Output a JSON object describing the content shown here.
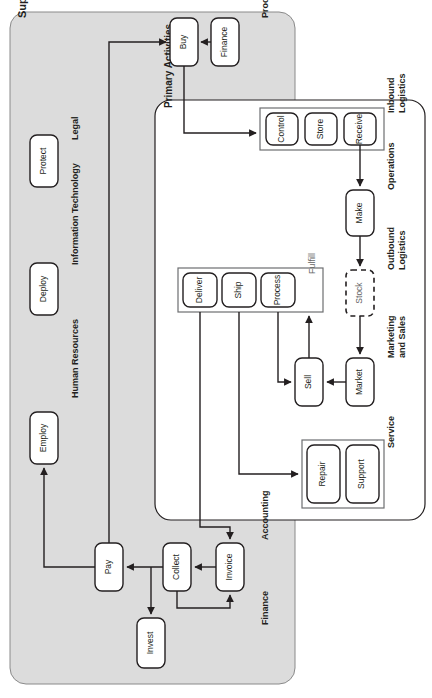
{
  "diagram": {
    "orientation": "rotated-90-ccw",
    "colors": {
      "panel_support_fill": "#dcdcdc",
      "panel_primary_fill": "#ffffff",
      "node_fill": "#ffffff",
      "stroke": "#231f20",
      "subgroup_stroke": "#6d6e71",
      "text": "#231f20"
    },
    "panels": [
      {
        "id": "support",
        "label": "Support Activities",
        "fill": "#dcdcdc"
      },
      {
        "id": "primary",
        "label": "Primary Activities",
        "fill": "#ffffff"
      }
    ],
    "sections": [
      {
        "id": "procurement",
        "label": "Procurement",
        "panel": "support"
      },
      {
        "id": "legal",
        "label": "Legal",
        "panel": "support"
      },
      {
        "id": "information_technology",
        "label": "Information Technology",
        "panel": "support"
      },
      {
        "id": "human_resources",
        "label": "Human Resources",
        "panel": "support"
      },
      {
        "id": "accounting",
        "label": "Accounting",
        "panel": "support"
      },
      {
        "id": "finance",
        "label": "Finance",
        "panel": "support"
      },
      {
        "id": "inbound_logistics",
        "label": "Inbound\nLogistics",
        "panel": "primary"
      },
      {
        "id": "operations",
        "label": "Operations",
        "panel": "primary"
      },
      {
        "id": "outbound_logistics",
        "label": "Outbound\nLogistics",
        "panel": "primary"
      },
      {
        "id": "marketing_and_sales",
        "label": "Marketing\nand Sales",
        "panel": "primary"
      },
      {
        "id": "service",
        "label": "Service",
        "panel": "primary"
      },
      {
        "id": "fulfill",
        "label": "Fulfill",
        "panel": "primary"
      }
    ],
    "section_labels": {
      "procurement": "Procurement",
      "legal": "Legal",
      "information_technology": "Information Technology",
      "human_resources": "Human Resources",
      "accounting": "Accounting",
      "finance": "Finance",
      "inbound_logistics_line1": "Inbound",
      "inbound_logistics_line2": "Logistics",
      "operations": "Operations",
      "outbound_logistics_line1": "Outbound",
      "outbound_logistics_line2": "Logistics",
      "marketing_line1": "Marketing",
      "marketing_line2": "and Sales",
      "service": "Service",
      "fulfill": "Fulfill",
      "support_activities": "Support Activities",
      "primary_activities": "Primary Activities"
    },
    "nodes": [
      {
        "id": "buy",
        "label": "Buy",
        "section": "procurement",
        "style": "solid"
      },
      {
        "id": "finance_node",
        "label": "Finance",
        "section": "procurement",
        "style": "solid"
      },
      {
        "id": "protect",
        "label": "Protect",
        "section": "legal",
        "style": "solid"
      },
      {
        "id": "deploy",
        "label": "Deploy",
        "section": "information_technology",
        "style": "solid"
      },
      {
        "id": "employ",
        "label": "Employ",
        "section": "human_resources",
        "style": "solid"
      },
      {
        "id": "pay",
        "label": "Pay",
        "section": "accounting",
        "style": "solid"
      },
      {
        "id": "collect",
        "label": "Collect",
        "section": "accounting",
        "style": "solid"
      },
      {
        "id": "invoice",
        "label": "Invoice",
        "section": "accounting",
        "style": "solid"
      },
      {
        "id": "invest",
        "label": "Invest",
        "section": "finance",
        "style": "solid"
      },
      {
        "id": "control",
        "label": "Control",
        "section": "inbound_logistics",
        "style": "solid"
      },
      {
        "id": "store",
        "label": "Store",
        "section": "inbound_logistics",
        "style": "solid"
      },
      {
        "id": "receive",
        "label": "Receive",
        "section": "inbound_logistics",
        "style": "solid"
      },
      {
        "id": "make",
        "label": "Make",
        "section": "operations",
        "style": "solid"
      },
      {
        "id": "stock",
        "label": "Stock",
        "section": "outbound_logistics",
        "style": "dashed"
      },
      {
        "id": "market",
        "label": "Market",
        "section": "marketing_and_sales",
        "style": "solid"
      },
      {
        "id": "sell",
        "label": "Sell",
        "section": "marketing_and_sales",
        "style": "solid"
      },
      {
        "id": "deliver",
        "label": "Deliver",
        "section": "fulfill",
        "style": "solid"
      },
      {
        "id": "ship",
        "label": "Ship",
        "section": "fulfill",
        "style": "solid"
      },
      {
        "id": "process",
        "label": "Process",
        "section": "fulfill",
        "style": "solid"
      },
      {
        "id": "repair",
        "label": "Repair",
        "section": "service",
        "style": "solid"
      },
      {
        "id": "support_node",
        "label": "Support",
        "section": "service",
        "style": "solid"
      }
    ],
    "edges": [
      {
        "from": "finance_node",
        "to": "buy"
      },
      {
        "from": "pay",
        "to": "buy"
      },
      {
        "from": "buy",
        "to": "receive"
      },
      {
        "from": "receive",
        "to": "make"
      },
      {
        "from": "make",
        "to": "stock"
      },
      {
        "from": "stock",
        "to": "market"
      },
      {
        "from": "market",
        "to": "sell"
      },
      {
        "from": "sell",
        "to": "process"
      },
      {
        "from": "process",
        "to": "sell"
      },
      {
        "from": "ship",
        "to": "repair"
      },
      {
        "from": "deliver",
        "to": "invoice"
      },
      {
        "from": "invoice",
        "to": "collect"
      },
      {
        "from": "collect",
        "to": "pay"
      },
      {
        "from": "collect",
        "to": "invest"
      },
      {
        "from": "collect",
        "to": "invoice"
      },
      {
        "from": "pay",
        "to": "employ"
      }
    ]
  }
}
